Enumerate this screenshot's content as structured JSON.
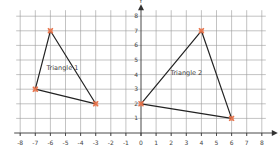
{
  "figure": {
    "title_fragment": "igure 7",
    "colors": {
      "grid": "#9a9a9a",
      "axis": "#333333",
      "edge": "#222222",
      "vertex_marker": "#e8734a",
      "text": "#444444"
    }
  },
  "chart_data": {
    "type": "scatter",
    "title": "",
    "xlabel": "X",
    "ylabel": "Y",
    "xlim": [
      -8,
      8
    ],
    "ylim": [
      0,
      8
    ],
    "grid": true,
    "x_ticks": [
      "-8",
      "-7",
      "-6",
      "-5",
      "-4",
      "-3",
      "-2",
      "-1",
      "0",
      "1",
      "2",
      "3",
      "4",
      "5",
      "6",
      "7",
      "8"
    ],
    "y_ticks": [
      "1",
      "2",
      "3",
      "4",
      "5",
      "6",
      "7",
      "8"
    ],
    "series": [
      {
        "name": "Triangle 1",
        "points": [
          [
            -6,
            7
          ],
          [
            -3,
            2
          ],
          [
            -7,
            3
          ]
        ]
      },
      {
        "name": "Triangle 2",
        "points": [
          [
            4,
            7
          ],
          [
            6,
            1
          ],
          [
            0,
            2
          ]
        ]
      }
    ]
  }
}
